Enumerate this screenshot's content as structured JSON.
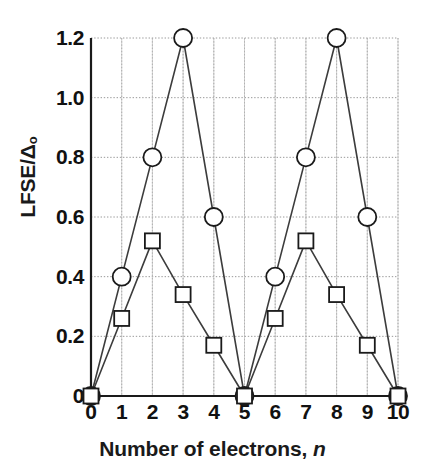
{
  "chart_data": {
    "type": "line",
    "title": "",
    "xlabel": "Number of electrons, n",
    "xlabel_plain": "Number of electrons,",
    "xlabel_italic": "n",
    "ylabel_main": "LFSE/Δ",
    "ylabel_sub": "o",
    "x": [
      0,
      1,
      2,
      3,
      4,
      5,
      6,
      7,
      8,
      9,
      10
    ],
    "xlim": [
      0,
      10
    ],
    "ylim": [
      0,
      1.2
    ],
    "xticks": [
      "0",
      "1",
      "2",
      "3",
      "4",
      "5",
      "6",
      "7",
      "8",
      "9",
      "10"
    ],
    "yticks": [
      "0",
      "0.2",
      "0.4",
      "0.6",
      "0.8",
      "1.0",
      "1.2"
    ],
    "ytick_values": [
      0,
      0.2,
      0.4,
      0.6,
      0.8,
      1.0,
      1.2
    ],
    "grid": true,
    "grid_style": "dotted",
    "legend": "none",
    "series": [
      {
        "name": "low-spin",
        "marker": "circle",
        "values": [
          0,
          0.4,
          0.8,
          1.2,
          0.6,
          0,
          0.4,
          0.8,
          1.2,
          0.6,
          0
        ]
      },
      {
        "name": "high-spin",
        "marker": "square",
        "values": [
          0,
          0.26,
          0.52,
          0.34,
          0.17,
          0,
          0.26,
          0.52,
          0.34,
          0.17,
          0
        ]
      }
    ],
    "colors": {
      "line": "#3c3c3c",
      "marker_fill": "#ffffff",
      "marker_stroke": "#1a1a1a",
      "axis": "#1a1a1a",
      "grid": "#9a9a9a",
      "text": "#111111",
      "background": "#ffffff"
    }
  }
}
